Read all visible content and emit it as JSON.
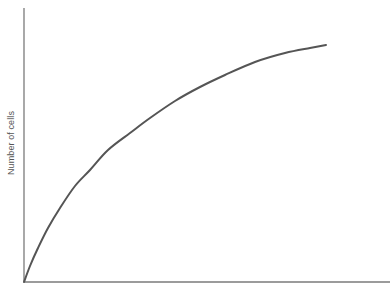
{
  "chart_data": {
    "type": "line",
    "title": "",
    "xlabel": "",
    "ylabel": "Number of cells",
    "grid": false,
    "legend": null,
    "ticks": {
      "x": [],
      "y": []
    },
    "axes": {
      "origin_px": [
        24,
        282
      ],
      "x_end_px": [
        390,
        282
      ],
      "y_end_px": [
        24,
        8
      ],
      "color": "#7a7a7a"
    },
    "series": [
      {
        "name": "growth-curve",
        "color": "#555555",
        "description": "Saturating (logarithmic-like) growth curve starting at the origin and leveling off toward the upper right",
        "points_px": [
          [
            24,
            282
          ],
          [
            30,
            266
          ],
          [
            38,
            248
          ],
          [
            48,
            228
          ],
          [
            60,
            208
          ],
          [
            75,
            186
          ],
          [
            90,
            170
          ],
          [
            108,
            150
          ],
          [
            130,
            133
          ],
          [
            150,
            118
          ],
          [
            175,
            101
          ],
          [
            200,
            87
          ],
          [
            225,
            75
          ],
          [
            255,
            62
          ],
          [
            285,
            53
          ],
          [
            310,
            48
          ],
          [
            326,
            45
          ]
        ]
      }
    ]
  }
}
